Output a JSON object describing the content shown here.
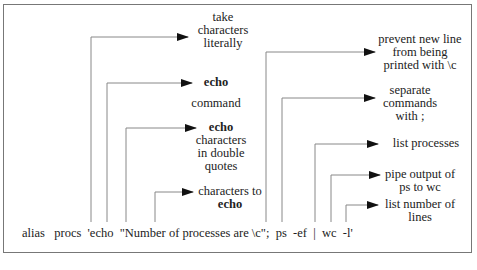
{
  "command": "alias   procs  'echo  \"Number of processes are \\c\";  ps  -ef  |  wc  -l'",
  "annotations": [
    {
      "id": "take-literally",
      "lines": [
        "take",
        "characters",
        "literally"
      ]
    },
    {
      "id": "echo-command",
      "lines": [
        "echo",
        "command"
      ]
    },
    {
      "id": "echo-double-quotes",
      "lines": [
        "echo",
        "characters",
        "in double",
        "quotes"
      ]
    },
    {
      "id": "chars-to-echo",
      "lines": [
        "characters to",
        "echo"
      ]
    },
    {
      "id": "prevent-newline",
      "lines": [
        "prevent new line",
        "from being",
        "printed with \\c"
      ]
    },
    {
      "id": "separate-commands",
      "lines": [
        "separate",
        "commands",
        "with  ;"
      ]
    },
    {
      "id": "list-processes",
      "lines": [
        "list processes"
      ]
    },
    {
      "id": "pipe-output",
      "lines": [
        "pipe output of",
        "ps to wc"
      ]
    },
    {
      "id": "list-lines",
      "lines": [
        "list number of",
        "lines"
      ]
    }
  ],
  "colors": {
    "line": "#888888",
    "arrow": "#111111",
    "border": "#777777"
  }
}
